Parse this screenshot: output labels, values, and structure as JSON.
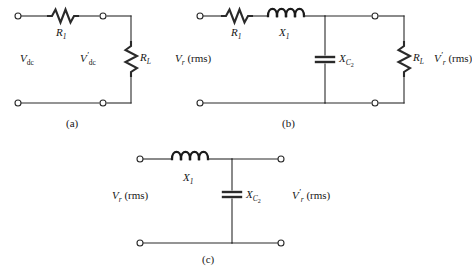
{
  "figure": {
    "background": "#ffffff",
    "line_color": "#2a2a2a",
    "text_color": "#161616"
  },
  "circuits": [
    {
      "id": "circuit-a",
      "caption": "(a)",
      "source_label_main": "V",
      "source_label_sub": "dc",
      "output_label_main": "V",
      "output_label_sub": "dc",
      "output_label_prime": "′",
      "series_resistor_main": "R",
      "series_resistor_sub": "1",
      "load_resistor_main": "R",
      "load_resistor_sub": "L",
      "components": [
        "series-resistor",
        "load-resistor"
      ]
    },
    {
      "id": "circuit-b",
      "caption": "(b)",
      "source_label_main": "V",
      "source_label_sub": "r",
      "source_label_suffix": " (rms)",
      "output_label_main": "V",
      "output_label_sub": "r",
      "output_label_prime": "′",
      "output_label_suffix": " (rms)",
      "series_resistor_main": "R",
      "series_resistor_sub": "1",
      "series_inductor_main": "X",
      "series_inductor_sub": "1",
      "shunt_capacitor_main": "X",
      "shunt_capacitor_sub": "C",
      "shunt_capacitor_sub2": "2",
      "load_resistor_main": "R",
      "load_resistor_sub": "L",
      "components": [
        "series-resistor",
        "series-inductor",
        "shunt-capacitor",
        "load-resistor"
      ]
    },
    {
      "id": "circuit-c",
      "caption": "(c)",
      "source_label_main": "V",
      "source_label_sub": "r",
      "source_label_suffix": " (rms)",
      "output_label_main": "V",
      "output_label_sub": "r",
      "output_label_prime": "′",
      "output_label_suffix": " (rms)",
      "series_inductor_main": "X",
      "series_inductor_sub": "1",
      "shunt_capacitor_main": "X",
      "shunt_capacitor_sub": "C",
      "shunt_capacitor_sub2": "2",
      "components": [
        "series-inductor",
        "shunt-capacitor"
      ]
    }
  ],
  "labels": {
    "a_vdc": "V",
    "a_vdc_sub": "dc",
    "a_vdc_out": "V",
    "a_vdc_out_sub": "dc",
    "a_r1": "R",
    "a_r1_sub": "1",
    "a_rl": "R",
    "a_rl_sub": "L",
    "a_caption": "(a)",
    "b_vr": "V",
    "b_vr_sub": "r",
    "b_rms": " (rms)",
    "b_r1": "R",
    "b_r1_sub": "1",
    "b_x1": "X",
    "b_x1_sub": "1",
    "b_xc2": "X",
    "b_xc2_sub": "C",
    "b_xc2_sub2": "2",
    "b_rl": "R",
    "b_rl_sub": "L",
    "b_vr_out": "V",
    "b_vr_out_sub": "r",
    "b_caption": "(b)",
    "c_x1": "X",
    "c_x1_sub": "1",
    "c_xc2": "X",
    "c_xc2_sub": "C",
    "c_xc2_sub2": "2",
    "c_vr": "V",
    "c_vr_sub": "r",
    "c_vr_out": "V",
    "c_vr_out_sub": "r",
    "c_caption": "(c)",
    "prime": "′"
  }
}
